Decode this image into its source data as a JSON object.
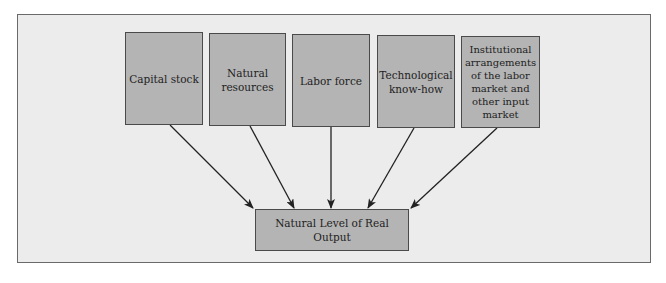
{
  "diagram": {
    "type": "flow-diagram",
    "inputs": [
      {
        "id": "capital",
        "label": "Capital stock"
      },
      {
        "id": "natural",
        "label": "Natural\nresources"
      },
      {
        "id": "labor",
        "label": "Labor force"
      },
      {
        "id": "tech",
        "label": "Technological\nknow-how"
      },
      {
        "id": "institutional",
        "label": "Institutional\narrangements\nof the labor\nmarket and\nother input\nmarket"
      }
    ],
    "output": {
      "id": "output",
      "label": "Natural Level of Real Output"
    },
    "edges": [
      {
        "from": "capital",
        "to": "output"
      },
      {
        "from": "natural",
        "to": "output"
      },
      {
        "from": "labor",
        "to": "output"
      },
      {
        "from": "tech",
        "to": "output"
      },
      {
        "from": "institutional",
        "to": "output"
      }
    ],
    "colors": {
      "background": "#ececec",
      "box_fill": "#b4b4b4",
      "box_border": "#4a4a4a",
      "arrow": "#222222"
    }
  }
}
